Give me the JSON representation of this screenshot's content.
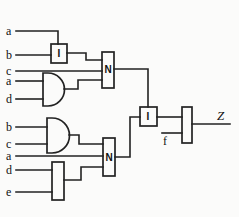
{
  "diagram": {
    "kind": "logic-circuit-schematic",
    "inputs_upper": [
      "a",
      "b",
      "c",
      "a",
      "d"
    ],
    "inputs_lower": [
      "b",
      "c",
      "a",
      "d",
      "e"
    ],
    "input_f": "f",
    "output_label": "Z",
    "gates": {
      "box_top": "I",
      "n_upper": "N",
      "n_lower": "N",
      "box_mid": "I"
    },
    "colors": {
      "line": "#222222",
      "background": "#fbfbfa"
    }
  }
}
